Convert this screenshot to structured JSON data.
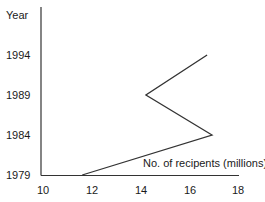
{
  "chart_data": {
    "type": "line",
    "title": "",
    "xlabel": "No. of recipents (millions)",
    "ylabel": "Year",
    "xlim": [
      10,
      18
    ],
    "x_ticks": [
      "10",
      "12",
      "14",
      "16",
      "18"
    ],
    "y_ticks": [
      "1979",
      "1984",
      "1989",
      "1994"
    ],
    "grid": false,
    "legend": null,
    "orientation": "vertical-time-axis",
    "series": [
      {
        "name": "No. of recipents (millions)",
        "points": [
          {
            "year": 1979,
            "value": 11.6
          },
          {
            "year": 1984,
            "value": 16.9
          },
          {
            "year": 1989,
            "value": 14.2
          },
          {
            "year": 1994,
            "value": 16.7
          }
        ]
      }
    ],
    "categories": [
      "1979",
      "1984",
      "1989",
      "1994"
    ],
    "values": [
      11.6,
      16.9,
      14.2,
      16.7
    ]
  },
  "labels": {
    "y_axis_title": "Year",
    "x_axis_title": "No. of recipents (millions)",
    "y_ticks": [
      "1994",
      "1989",
      "1984",
      "1979"
    ],
    "x_ticks": [
      "10",
      "12",
      "14",
      "16",
      "18"
    ]
  },
  "colors": {
    "line": "#333333",
    "axis": "#333333",
    "text": "#1a1a1a",
    "background": "#ffffff"
  }
}
